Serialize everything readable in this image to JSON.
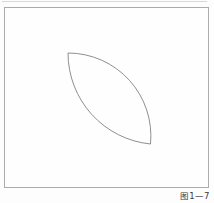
{
  "figure": {
    "caption": "图1—7",
    "leaf_path": "M 68 53 A 83 83 0 0 1 150.5 144 A 91.5 91.5 0 0 1 68 53 Z",
    "colors": {
      "frame_border": "#ababab",
      "curve_stroke": "#8f8f8f",
      "page_edge_line": "#d9d9d9",
      "caption_text": "#3a3a3a",
      "background": "#fdfdfd"
    }
  }
}
